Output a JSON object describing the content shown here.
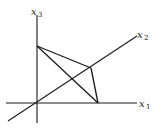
{
  "diagram": {
    "type": "3d-coordinate-axes-with-triangle",
    "axes": [
      {
        "id": "x1",
        "label": "x",
        "subscript": "1",
        "direction": "right"
      },
      {
        "id": "x2",
        "label": "x",
        "subscript": "2",
        "direction": "diagonal-up-right"
      },
      {
        "id": "x3",
        "label": "x",
        "subscript": "3",
        "direction": "up"
      }
    ],
    "triangle": {
      "vertices": [
        {
          "id": "A",
          "on_axis": "x3"
        },
        {
          "id": "B",
          "on_axis": "x2"
        },
        {
          "id": "C",
          "on_axis": "x1"
        }
      ],
      "edges": [
        [
          "A",
          "B"
        ],
        [
          "B",
          "C"
        ],
        [
          "A",
          "C"
        ]
      ]
    }
  }
}
